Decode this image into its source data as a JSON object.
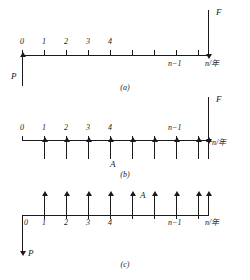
{
  "figure": {
    "type": "cash-flow-diagram",
    "axis_color": "#1a1a1a",
    "background": "#ffffff"
  },
  "panels": [
    {
      "id": "a",
      "caption": "(a)",
      "axis_label": "n/年",
      "tick_labels": [
        "0",
        "1",
        "2",
        "3",
        "4"
      ],
      "near_end_label": "n−1",
      "arrows": [
        {
          "name": "P",
          "label": "P",
          "direction": "up",
          "at": "0"
        },
        {
          "name": "F",
          "label": "F",
          "direction": "down",
          "at": "n"
        }
      ]
    },
    {
      "id": "b",
      "caption": "(b)",
      "axis_label": "n/年",
      "tick_labels": [
        "0",
        "1",
        "2",
        "3",
        "4"
      ],
      "near_end_label": "n−1",
      "series_label": "A",
      "arrows": [
        {
          "name": "F",
          "label": "F",
          "direction": "down",
          "at": "n"
        }
      ],
      "annuity": {
        "label": "A",
        "direction": "down",
        "count": 9
      }
    },
    {
      "id": "c",
      "caption": "(c)",
      "axis_label": "n/年",
      "tick_labels": [
        "0",
        "1",
        "2",
        "3",
        "4"
      ],
      "near_end_label": "n−1",
      "series_label": "A",
      "arrows": [
        {
          "name": "P",
          "label": "P",
          "direction": "down",
          "at": "0"
        }
      ],
      "annuity": {
        "label": "A",
        "direction": "up",
        "count": 9
      }
    }
  ]
}
